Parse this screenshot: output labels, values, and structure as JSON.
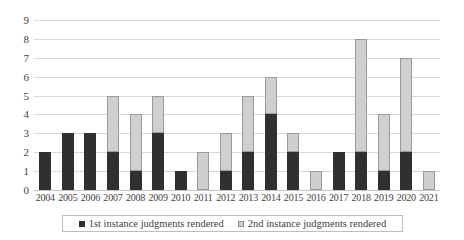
{
  "chart_data": {
    "type": "bar",
    "subtype": "stacked-column",
    "title": "",
    "subtitle": "",
    "xlabel": "",
    "ylabel": "",
    "ylim": [
      0,
      9
    ],
    "ytick_values": [
      0,
      1,
      2,
      3,
      4,
      5,
      6,
      7,
      8,
      9
    ],
    "ytick_labels": [
      "0",
      "1",
      "2",
      "3",
      "4",
      "5",
      "6",
      "7",
      "8",
      "9"
    ],
    "grid": true,
    "legend_position": "bottom",
    "categories": [
      "2004",
      "2005",
      "2006",
      "2007",
      "2008",
      "2009",
      "2010",
      "2011",
      "2012",
      "2013",
      "2014",
      "2015",
      "2016",
      "2017",
      "2018",
      "2019",
      "2020",
      "2021"
    ],
    "series": [
      {
        "name": "1st instance judgments rendered",
        "color": "#303030",
        "values": [
          2,
          3,
          3,
          2,
          1,
          3,
          1,
          0,
          1,
          2,
          4,
          2,
          0,
          2,
          2,
          1,
          2,
          0
        ]
      },
      {
        "name": "2nd instance judgments rendered",
        "color": "#cfcfcf",
        "values": [
          0,
          0,
          0,
          3,
          3,
          2,
          0,
          2,
          2,
          3,
          2,
          1,
          1,
          0,
          6,
          3,
          5,
          1
        ]
      }
    ],
    "totals": [
      2,
      3,
      3,
      5,
      4,
      5,
      1,
      2,
      3,
      5,
      6,
      3,
      1,
      2,
      8,
      4,
      7,
      1
    ]
  },
  "legend": {
    "entries": [
      {
        "label": "1st instance judgments rendered"
      },
      {
        "label": "2nd instance judgments rendered"
      }
    ]
  },
  "colors": {
    "series_first_instance": "#303030",
    "series_second_instance": "#cfcfcf",
    "gridline": "#d9d9d9",
    "text": "#3f3f3f",
    "background": "#ffffff"
  }
}
